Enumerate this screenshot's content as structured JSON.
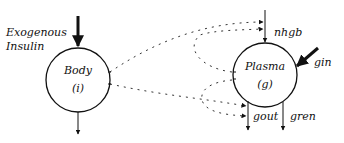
{
  "diagram": {
    "nodes": {
      "body": {
        "name": "Body",
        "symbol": "(i)"
      },
      "plasma": {
        "name": "Plasma",
        "symbol": "(g)"
      }
    },
    "inputs": {
      "exogenous_insulin_line1": "Exogenous",
      "exogenous_insulin_line2": "Insulin",
      "nhgb": "nhgb",
      "gin": "gin"
    },
    "outputs": {
      "gout": "gout",
      "gren": "gren"
    }
  }
}
